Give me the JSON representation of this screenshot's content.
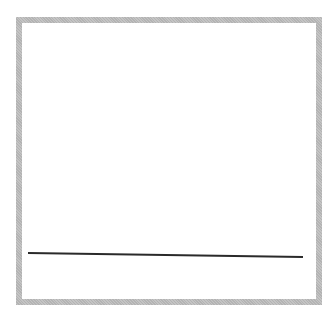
{
  "canvas": {
    "width": 336,
    "height": 329,
    "background": "#ffffff"
  },
  "frame": {
    "border_color": "#c4c4c4",
    "border_width": 6
  },
  "drawing": {
    "strokes": [
      {
        "name": "horizontal-line",
        "x1": 28,
        "y1": 253,
        "x2": 303,
        "y2": 257,
        "color": "#2a2a2a",
        "width": 2
      }
    ]
  }
}
